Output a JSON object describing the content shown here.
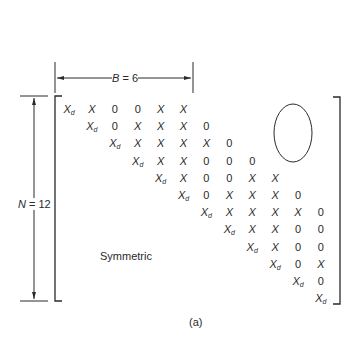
{
  "figure": {
    "caption": "(a)",
    "bandwidth_label": {
      "var": "B",
      "eq": " = 6"
    },
    "size_label": {
      "var": "N",
      "eq": " = 12"
    },
    "lower_triangle_label": "Symmetric",
    "diagonal_symbol": "X",
    "diagonal_subscript": "d",
    "nonzero_symbol": "X",
    "zero_symbol": "0"
  },
  "matrix": {
    "n": 12,
    "bandwidth": 6,
    "rows": [
      [
        "Xd",
        "X",
        "0",
        "0",
        "X",
        "X"
      ],
      [
        "Xd",
        "0",
        "X",
        "X",
        "X",
        "0"
      ],
      [
        "Xd",
        "X",
        "X",
        "X",
        "X",
        "0"
      ],
      [
        "Xd",
        "X",
        "X",
        "0",
        "0",
        "0"
      ],
      [
        "Xd",
        "X",
        "0",
        "0",
        "X",
        "X"
      ],
      [
        "Xd",
        "0",
        "X",
        "X",
        "X",
        "0"
      ],
      [
        "Xd",
        "X",
        "X",
        "X",
        "X",
        "0"
      ],
      [
        "Xd",
        "X",
        "X",
        "0",
        "0"
      ],
      [
        "Xd",
        "X",
        "0",
        "0"
      ],
      [
        "Xd",
        "0",
        "X"
      ],
      [
        "Xd",
        "0"
      ],
      [
        "Xd"
      ]
    ]
  },
  "style": {
    "ink": "#2a2a2a"
  }
}
